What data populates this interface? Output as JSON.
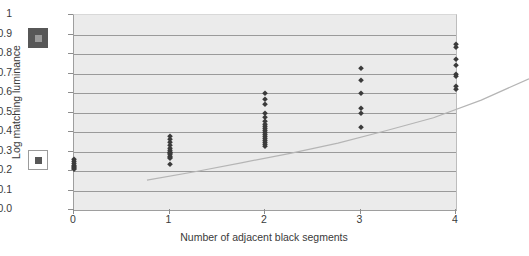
{
  "chart_data": {
    "type": "scatter",
    "title": "",
    "xlabel": "Number of adjacent black segments",
    "ylabel": "Log matching luminance",
    "xlim": [
      0,
      4
    ],
    "ylim": [
      0.0,
      1.0
    ],
    "grid": true,
    "legend_position": "none",
    "xticks": [
      "0",
      "1",
      "2",
      "3",
      "4"
    ],
    "yticks": [
      "0.0",
      "0.1",
      "0.2",
      "0.3",
      "0.4",
      "0.5",
      "0.6",
      "0.7",
      "0.8",
      "0.9",
      "1"
    ],
    "series": [
      {
        "name": "Matching luminance data",
        "marker": "diamond",
        "color": "#3b3b3b",
        "points": [
          {
            "x": 0,
            "y": 0.26
          },
          {
            "x": 0,
            "y": 0.25
          },
          {
            "x": 0,
            "y": 0.24
          },
          {
            "x": 0,
            "y": 0.23
          },
          {
            "x": 0,
            "y": 0.225
          },
          {
            "x": 0,
            "y": 0.22
          },
          {
            "x": 0,
            "y": 0.215
          },
          {
            "x": 0,
            "y": 0.21
          },
          {
            "x": 1,
            "y": 0.38
          },
          {
            "x": 1,
            "y": 0.365
          },
          {
            "x": 1,
            "y": 0.35
          },
          {
            "x": 1,
            "y": 0.335
          },
          {
            "x": 1,
            "y": 0.32
          },
          {
            "x": 1,
            "y": 0.31
          },
          {
            "x": 1,
            "y": 0.3
          },
          {
            "x": 1,
            "y": 0.295
          },
          {
            "x": 1,
            "y": 0.29
          },
          {
            "x": 1,
            "y": 0.285
          },
          {
            "x": 1,
            "y": 0.275
          },
          {
            "x": 1,
            "y": 0.27
          },
          {
            "x": 1,
            "y": 0.265
          },
          {
            "x": 1,
            "y": 0.235
          },
          {
            "x": 2,
            "y": 0.6
          },
          {
            "x": 2,
            "y": 0.57
          },
          {
            "x": 2,
            "y": 0.545
          },
          {
            "x": 2,
            "y": 0.5
          },
          {
            "x": 2,
            "y": 0.475
          },
          {
            "x": 2,
            "y": 0.455
          },
          {
            "x": 2,
            "y": 0.44
          },
          {
            "x": 2,
            "y": 0.43
          },
          {
            "x": 2,
            "y": 0.42
          },
          {
            "x": 2,
            "y": 0.41
          },
          {
            "x": 2,
            "y": 0.4
          },
          {
            "x": 2,
            "y": 0.39
          },
          {
            "x": 2,
            "y": 0.38
          },
          {
            "x": 2,
            "y": 0.37
          },
          {
            "x": 2,
            "y": 0.36
          },
          {
            "x": 2,
            "y": 0.35
          },
          {
            "x": 2,
            "y": 0.34
          },
          {
            "x": 2,
            "y": 0.33
          },
          {
            "x": 3,
            "y": 0.73
          },
          {
            "x": 3,
            "y": 0.665
          },
          {
            "x": 3,
            "y": 0.6
          },
          {
            "x": 3,
            "y": 0.525
          },
          {
            "x": 3,
            "y": 0.495
          },
          {
            "x": 3,
            "y": 0.425
          },
          {
            "x": 4,
            "y": 0.85
          },
          {
            "x": 4,
            "y": 0.835
          },
          {
            "x": 4,
            "y": 0.775
          },
          {
            "x": 4,
            "y": 0.745
          },
          {
            "x": 4,
            "y": 0.7
          },
          {
            "x": 4,
            "y": 0.685
          },
          {
            "x": 4,
            "y": 0.635
          },
          {
            "x": 4,
            "y": 0.62
          }
        ]
      }
    ],
    "trendline": {
      "name": "fitted curve",
      "color": "#b5b5b5",
      "points": [
        {
          "x": 0,
          "y": 0.225
        },
        {
          "x": 0.5,
          "y": 0.268
        },
        {
          "x": 1,
          "y": 0.315
        },
        {
          "x": 1.5,
          "y": 0.362
        },
        {
          "x": 2,
          "y": 0.415
        },
        {
          "x": 2.5,
          "y": 0.478
        },
        {
          "x": 3,
          "y": 0.545
        },
        {
          "x": 3.5,
          "y": 0.635
        },
        {
          "x": 4,
          "y": 0.745
        }
      ]
    },
    "markers_legend": [
      {
        "name": "dark-square-swatch",
        "fill": "#575757",
        "inner": "#9a9a9a",
        "approx_y": 0.85
      },
      {
        "name": "light-square-swatch",
        "fill": "#ffffff",
        "inner": "#585858",
        "border": "#9b9b9b",
        "approx_y": 0.25
      }
    ]
  }
}
